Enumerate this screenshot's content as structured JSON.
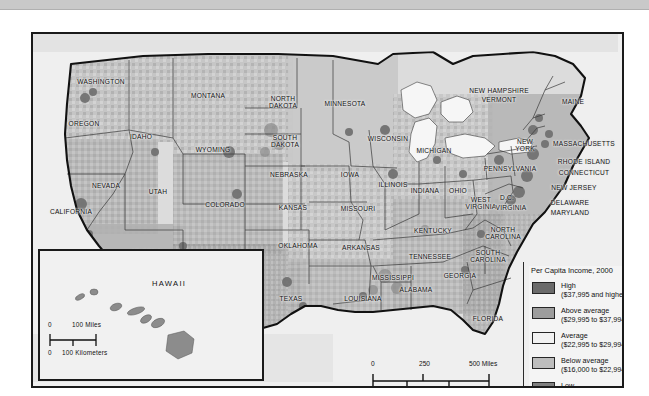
{
  "map": {
    "title": "Per Capita Income, 2000",
    "subject": "United States per capita income by county, 2000",
    "legend": {
      "title": "Per Capita Income, 2000",
      "classes": [
        {
          "label": "High",
          "range": "($37,995 and higher)",
          "color": "#6b6b6b"
        },
        {
          "label": "Above average",
          "range": "($29,995 to $37,994)",
          "color": "#9d9d9d"
        },
        {
          "label": "Average",
          "range": "($22,995 to $29,994)",
          "color": "#f2f2f2"
        },
        {
          "label": "Below average",
          "range": "($16,000 to $22,994)",
          "color": "#bdbdbd"
        },
        {
          "label": "Low",
          "range": "(Below $16,000)",
          "color": "#7f7f7f"
        }
      ]
    },
    "scale_bar": {
      "miles": {
        "ticks": [
          "0",
          "250",
          "500 Miles"
        ]
      },
      "kilometers": {
        "ticks": [
          "0",
          "250",
          "500 Kilometers"
        ]
      }
    },
    "inset": {
      "name": "HAWAII",
      "scale_bar": {
        "miles": {
          "ticks": [
            "0",
            "100 Miles"
          ]
        },
        "kilometers": {
          "ticks": [
            "0",
            "100 Kilometers"
          ]
        }
      }
    },
    "state_labels": [
      {
        "name": "WASHINGTON",
        "x": 68,
        "y": 48,
        "lines": [
          "WASHINGTON"
        ]
      },
      {
        "name": "OREGON",
        "x": 51,
        "y": 90,
        "lines": [
          "OREGON"
        ]
      },
      {
        "name": "IDAHO",
        "x": 108,
        "y": 103,
        "lines": [
          "IDAHO"
        ]
      },
      {
        "name": "MONTANA",
        "x": 175,
        "y": 62,
        "lines": [
          "MONTANA"
        ]
      },
      {
        "name": "WYOMING",
        "x": 180,
        "y": 116,
        "lines": [
          "WYOMING"
        ]
      },
      {
        "name": "NEVADA",
        "x": 73,
        "y": 152,
        "lines": [
          "NEVADA"
        ]
      },
      {
        "name": "CALIFORNIA",
        "x": 38,
        "y": 178,
        "lines": [
          "CALIFORNIA"
        ]
      },
      {
        "name": "UTAH",
        "x": 125,
        "y": 158,
        "lines": [
          "UTAH"
        ]
      },
      {
        "name": "ARIZONA",
        "x": 113,
        "y": 219,
        "lines": [
          "ARIZONA"
        ]
      },
      {
        "name": "NEW MEXICO",
        "x": 168,
        "y": 228,
        "lines": [
          "NEW",
          "MEXICO"
        ]
      },
      {
        "name": "COLORADO",
        "x": 192,
        "y": 171,
        "lines": [
          "COLORADO"
        ]
      },
      {
        "name": "NORTH DAKOTA",
        "x": 250,
        "y": 68,
        "lines": [
          "NORTH",
          "DAKOTA"
        ]
      },
      {
        "name": "SOUTH DAKOTA",
        "x": 252,
        "y": 107,
        "lines": [
          "SOUTH",
          "DAKOTA"
        ]
      },
      {
        "name": "NEBRASKA",
        "x": 256,
        "y": 141,
        "lines": [
          "NEBRASKA"
        ]
      },
      {
        "name": "KANSAS",
        "x": 260,
        "y": 174,
        "lines": [
          "KANSAS"
        ]
      },
      {
        "name": "OKLAHOMA",
        "x": 265,
        "y": 212,
        "lines": [
          "OKLAHOMA"
        ]
      },
      {
        "name": "TEXAS",
        "x": 258,
        "y": 265,
        "lines": [
          "TEXAS"
        ]
      },
      {
        "name": "MINNESOTA",
        "x": 312,
        "y": 70,
        "lines": [
          "MINNESOTA"
        ]
      },
      {
        "name": "IOWA",
        "x": 317,
        "y": 141,
        "lines": [
          "IOWA"
        ]
      },
      {
        "name": "MISSOURI",
        "x": 325,
        "y": 175,
        "lines": [
          "MISSOURI"
        ]
      },
      {
        "name": "ARKANSAS",
        "x": 328,
        "y": 214,
        "lines": [
          "ARKANSAS"
        ]
      },
      {
        "name": "LOUISIANA",
        "x": 330,
        "y": 265,
        "lines": [
          "LOUISIANA"
        ]
      },
      {
        "name": "WISCONSIN",
        "x": 355,
        "y": 105,
        "lines": [
          "WISCONSIN"
        ]
      },
      {
        "name": "ILLINOIS",
        "x": 360,
        "y": 151,
        "lines": [
          "ILLINOIS"
        ]
      },
      {
        "name": "MICHIGAN",
        "x": 401,
        "y": 117,
        "lines": [
          "MICHIGAN"
        ]
      },
      {
        "name": "INDIANA",
        "x": 392,
        "y": 157,
        "lines": [
          "INDIANA"
        ]
      },
      {
        "name": "OHIO",
        "x": 425,
        "y": 157,
        "lines": [
          "OHIO"
        ]
      },
      {
        "name": "KENTUCKY",
        "x": 400,
        "y": 197,
        "lines": [
          "KENTUCKY"
        ]
      },
      {
        "name": "TENNESSEE",
        "x": 397,
        "y": 223,
        "lines": [
          "TENNESSEE"
        ]
      },
      {
        "name": "MISSISSIPPI",
        "x": 360,
        "y": 244,
        "lines": [
          "MISSISSIPPI"
        ]
      },
      {
        "name": "ALABAMA",
        "x": 383,
        "y": 256,
        "lines": [
          "ALABAMA"
        ]
      },
      {
        "name": "GEORGIA",
        "x": 427,
        "y": 242,
        "lines": [
          "GEORGIA"
        ]
      },
      {
        "name": "FLORIDA",
        "x": 455,
        "y": 285,
        "lines": [
          "FLORIDA"
        ]
      },
      {
        "name": "SOUTH CAROLINA",
        "x": 455,
        "y": 222,
        "lines": [
          "SOUTH",
          "CAROLINA"
        ]
      },
      {
        "name": "NORTH CAROLINA",
        "x": 470,
        "y": 199,
        "lines": [
          "NORTH",
          "CAROLINA"
        ]
      },
      {
        "name": "WEST VIRGINIA",
        "x": 448,
        "y": 169,
        "lines": [
          "WEST",
          "VIRGINIA"
        ]
      },
      {
        "name": "VIRGINIA",
        "x": 478,
        "y": 174,
        "lines": [
          "VIRGINIA"
        ]
      },
      {
        "name": "D.C.",
        "x": 474,
        "y": 164,
        "lines": [
          "D.C."
        ]
      },
      {
        "name": "PENNSYLVANIA",
        "x": 477,
        "y": 135,
        "lines": [
          "PENNSYLVANIA"
        ]
      },
      {
        "name": "NEW YORK",
        "x": 492,
        "y": 111,
        "lines": [
          "NEW",
          "YORK"
        ]
      },
      {
        "name": "NEW JERSEY",
        "x": 541,
        "y": 154,
        "lines": [
          "NEW JERSEY"
        ]
      },
      {
        "name": "DELAWARE",
        "x": 537,
        "y": 169,
        "lines": [
          "DELAWARE"
        ]
      },
      {
        "name": "MARYLAND",
        "x": 537,
        "y": 179,
        "lines": [
          "MARYLAND"
        ]
      },
      {
        "name": "CONNECTICUT",
        "x": 551,
        "y": 139,
        "lines": [
          "CONNECTICUT"
        ]
      },
      {
        "name": "RHODE ISLAND",
        "x": 551,
        "y": 128,
        "lines": [
          "RHODE ISLAND"
        ]
      },
      {
        "name": "MASSACHUSETTS",
        "x": 551,
        "y": 110,
        "lines": [
          "MASSACHUSETTS"
        ]
      },
      {
        "name": "NEW HAMPSHIRE",
        "x": 466,
        "y": 57,
        "lines": [
          "NEW HAMPSHIRE"
        ]
      },
      {
        "name": "VERMONT",
        "x": 466,
        "y": 66,
        "lines": [
          "VERMONT"
        ]
      },
      {
        "name": "MAINE",
        "x": 540,
        "y": 68,
        "lines": [
          "MAINE"
        ]
      }
    ]
  }
}
